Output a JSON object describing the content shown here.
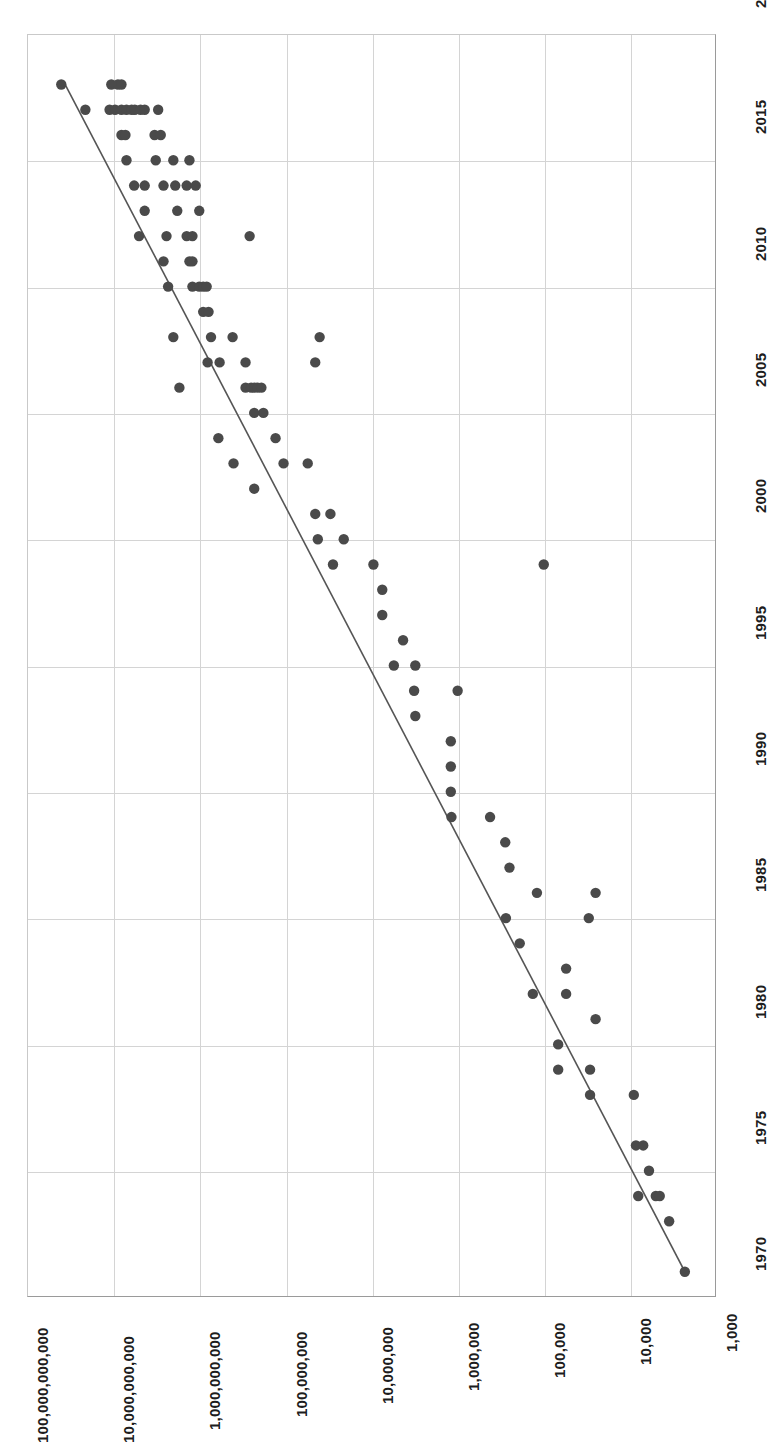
{
  "chart_data": {
    "type": "scatter",
    "title": "",
    "subtitle": "",
    "xlabel": "",
    "ylabel": "",
    "orientation": "rotated-90",
    "grid": true,
    "legend": null,
    "value_axis": {
      "name": "value-axis",
      "scale": "log",
      "position": "bottom",
      "direction": "descending-left-to-right",
      "tick_labels": [
        "100,000,000,000",
        "10,000,000,000",
        "1,000,000,000",
        "100,000,000",
        "10,000,000",
        "1,000,000",
        "100,000",
        "10,000",
        "1,000"
      ],
      "tick_values": [
        100000000000,
        10000000000,
        1000000000,
        100000000,
        10000000,
        1000000,
        100000,
        10000,
        1000
      ],
      "range": [
        1000,
        100000000000
      ]
    },
    "year_axis": {
      "name": "year-axis",
      "scale": "linear",
      "position": "right",
      "direction": "descending-top-to-bottom",
      "tick_labels": [
        "2020",
        "2015",
        "2010",
        "2005",
        "2000",
        "1995",
        "1990",
        "1985",
        "1980",
        "1975",
        "1970"
      ],
      "tick_values": [
        2020,
        2015,
        2010,
        2005,
        2000,
        1995,
        1990,
        1985,
        1980,
        1975,
        1970
      ],
      "range": [
        1970,
        2020
      ]
    },
    "series": [
      {
        "name": "data-points",
        "marker": "circle",
        "color": "#4a4a4a",
        "points": [
          {
            "year": 2018,
            "value": 40000000000
          },
          {
            "year": 2018,
            "value": 10500000000
          },
          {
            "year": 2018,
            "value": 8800000000
          },
          {
            "year": 2018,
            "value": 8000000000
          },
          {
            "year": 2017,
            "value": 21000000000
          },
          {
            "year": 2017,
            "value": 11000000000
          },
          {
            "year": 2017,
            "value": 9500000000
          },
          {
            "year": 2017,
            "value": 8000000000
          },
          {
            "year": 2017,
            "value": 7000000000
          },
          {
            "year": 2017,
            "value": 6100000000
          },
          {
            "year": 2017,
            "value": 5600000000
          },
          {
            "year": 2017,
            "value": 4800000000
          },
          {
            "year": 2017,
            "value": 4300000000
          },
          {
            "year": 2017,
            "value": 3000000000
          },
          {
            "year": 2016,
            "value": 8000000000
          },
          {
            "year": 2016,
            "value": 7200000000
          },
          {
            "year": 2016,
            "value": 3300000000
          },
          {
            "year": 2016,
            "value": 2800000000
          },
          {
            "year": 2015,
            "value": 7000000000
          },
          {
            "year": 2015,
            "value": 3200000000
          },
          {
            "year": 2015,
            "value": 2000000000
          },
          {
            "year": 2015,
            "value": 1300000000
          },
          {
            "year": 2014,
            "value": 5700000000
          },
          {
            "year": 2014,
            "value": 4300000000
          },
          {
            "year": 2014,
            "value": 2600000000
          },
          {
            "year": 2014,
            "value": 1900000000
          },
          {
            "year": 2014,
            "value": 1400000000
          },
          {
            "year": 2014,
            "value": 1100000000
          },
          {
            "year": 2013,
            "value": 4300000000
          },
          {
            "year": 2013,
            "value": 1800000000
          },
          {
            "year": 2013,
            "value": 1000000000
          },
          {
            "year": 2012,
            "value": 5000000000
          },
          {
            "year": 2012,
            "value": 2400000000
          },
          {
            "year": 2012,
            "value": 1400000000
          },
          {
            "year": 2012,
            "value": 1200000000
          },
          {
            "year": 2012,
            "value": 260000000
          },
          {
            "year": 2011,
            "value": 2600000000
          },
          {
            "year": 2011,
            "value": 1300000000
          },
          {
            "year": 2011,
            "value": 1200000000
          },
          {
            "year": 2010,
            "value": 2300000000
          },
          {
            "year": 2010,
            "value": 1200000000
          },
          {
            "year": 2010,
            "value": 1000000000
          },
          {
            "year": 2010,
            "value": 900000000
          },
          {
            "year": 2010,
            "value": 820000000
          },
          {
            "year": 2009,
            "value": 900000000
          },
          {
            "year": 2009,
            "value": 780000000
          },
          {
            "year": 2008,
            "value": 2000000000
          },
          {
            "year": 2008,
            "value": 730000000
          },
          {
            "year": 2008,
            "value": 410000000
          },
          {
            "year": 2008,
            "value": 40000000
          },
          {
            "year": 2007,
            "value": 800000000
          },
          {
            "year": 2007,
            "value": 580000000
          },
          {
            "year": 2007,
            "value": 290000000
          },
          {
            "year": 2007,
            "value": 45000000
          },
          {
            "year": 2006,
            "value": 1700000000
          },
          {
            "year": 2006,
            "value": 290000000
          },
          {
            "year": 2006,
            "value": 250000000
          },
          {
            "year": 2006,
            "value": 230000000
          },
          {
            "year": 2006,
            "value": 210000000
          },
          {
            "year": 2006,
            "value": 190000000
          },
          {
            "year": 2005,
            "value": 230000000
          },
          {
            "year": 2005,
            "value": 180000000
          },
          {
            "year": 2004,
            "value": 600000000
          },
          {
            "year": 2004,
            "value": 130000000
          },
          {
            "year": 2003,
            "value": 400000000
          },
          {
            "year": 2003,
            "value": 105000000
          },
          {
            "year": 2003,
            "value": 55000000
          },
          {
            "year": 2002,
            "value": 230000000
          },
          {
            "year": 2001,
            "value": 45000000
          },
          {
            "year": 2001,
            "value": 30000000
          },
          {
            "year": 2000,
            "value": 42000000
          },
          {
            "year": 2000,
            "value": 21000000
          },
          {
            "year": 1999,
            "value": 28000000
          },
          {
            "year": 1999,
            "value": 9500000
          },
          {
            "year": 1999,
            "value": 100000
          },
          {
            "year": 1998,
            "value": 7500000
          },
          {
            "year": 1997,
            "value": 7500000
          },
          {
            "year": 1996,
            "value": 4300000
          },
          {
            "year": 1995,
            "value": 5500000
          },
          {
            "year": 1995,
            "value": 3100000
          },
          {
            "year": 1994,
            "value": 3200000
          },
          {
            "year": 1994,
            "value": 1000000
          },
          {
            "year": 1993,
            "value": 3100000
          },
          {
            "year": 1992,
            "value": 1200000
          },
          {
            "year": 1991,
            "value": 1200000
          },
          {
            "year": 1990,
            "value": 1200000
          },
          {
            "year": 1989,
            "value": 1180000
          },
          {
            "year": 1989,
            "value": 420000
          },
          {
            "year": 1988,
            "value": 280000
          },
          {
            "year": 1987,
            "value": 250000
          },
          {
            "year": 1986,
            "value": 120000
          },
          {
            "year": 1986,
            "value": 25000
          },
          {
            "year": 1985,
            "value": 275000
          },
          {
            "year": 1985,
            "value": 30000
          },
          {
            "year": 1984,
            "value": 190000
          },
          {
            "year": 1983,
            "value": 55000
          },
          {
            "year": 1982,
            "value": 134000
          },
          {
            "year": 1982,
            "value": 55000
          },
          {
            "year": 1981,
            "value": 25000
          },
          {
            "year": 1980,
            "value": 68000
          },
          {
            "year": 1979,
            "value": 68000
          },
          {
            "year": 1979,
            "value": 29000
          },
          {
            "year": 1978,
            "value": 29000
          },
          {
            "year": 1978,
            "value": 9000
          },
          {
            "year": 1976,
            "value": 8500
          },
          {
            "year": 1976,
            "value": 7000
          },
          {
            "year": 1975,
            "value": 6000
          },
          {
            "year": 1974,
            "value": 8000
          },
          {
            "year": 1974,
            "value": 5000
          },
          {
            "year": 1974,
            "value": 4500
          },
          {
            "year": 1973,
            "value": 3500
          },
          {
            "year": 1971,
            "value": 2300
          }
        ]
      }
    ],
    "trendline": {
      "name": "trend-line",
      "color": "#555555",
      "start": {
        "year": 1971,
        "value": 2300
      },
      "end": {
        "year": 2018,
        "value": 36000000000
      }
    },
    "point_count": 111
  }
}
